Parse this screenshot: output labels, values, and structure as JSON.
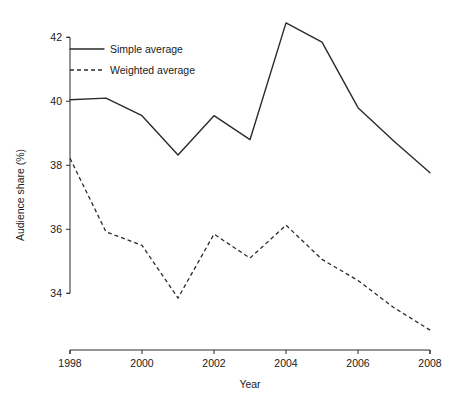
{
  "chart_data": {
    "type": "line",
    "title": "",
    "xlabel": "Year",
    "ylabel": "Audience share (%)",
    "x": [
      1998,
      1999,
      2000,
      2001,
      2002,
      2003,
      2004,
      2005,
      2006,
      2007,
      2008
    ],
    "xlim": [
      1998,
      2008
    ],
    "ylim": [
      32.7,
      42.6
    ],
    "xticks": [
      1998,
      2000,
      2002,
      2004,
      2006,
      2008
    ],
    "xtick_labels": [
      "1998",
      "2000",
      "2002",
      "2004",
      "2006",
      "2008"
    ],
    "yticks": [
      34,
      36,
      38,
      40,
      42
    ],
    "ytick_labels": [
      "34",
      "36",
      "38",
      "40",
      "42"
    ],
    "grid": false,
    "legend_position": "upper left",
    "series": [
      {
        "name": "Simple average",
        "style": "solid",
        "color": "#2b2b2b",
        "values": [
          40.05,
          40.1,
          39.55,
          38.32,
          39.55,
          38.8,
          42.45,
          41.85,
          39.8,
          38.75,
          37.77
        ]
      },
      {
        "name": "Weighted average",
        "style": "dashed",
        "color": "#2b2b2b",
        "values": [
          38.22,
          35.92,
          35.5,
          33.85,
          35.85,
          35.1,
          36.13,
          35.06,
          34.4,
          33.55,
          32.85
        ]
      }
    ]
  }
}
